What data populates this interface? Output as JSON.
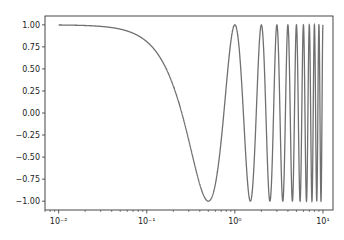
{
  "chart_data": {
    "type": "line",
    "title": "",
    "xlabel": "",
    "ylabel": "",
    "xscale": "log",
    "xlim": [
      0.007,
      13
    ],
    "ylim": [
      -1.1,
      1.1
    ],
    "grid": false,
    "legend": null,
    "x_ticks": [
      {
        "value": 0.01,
        "label": "10⁻²"
      },
      {
        "value": 0.1,
        "label": "10⁻¹"
      },
      {
        "value": 1,
        "label": "10⁰"
      },
      {
        "value": 10,
        "label": "10¹"
      }
    ],
    "y_ticks": [
      {
        "value": 1.0,
        "label": "1.00"
      },
      {
        "value": 0.75,
        "label": "0.75"
      },
      {
        "value": 0.5,
        "label": "0.50"
      },
      {
        "value": 0.25,
        "label": "0.25"
      },
      {
        "value": 0.0,
        "label": "0.00"
      },
      {
        "value": -0.25,
        "label": "−0.25"
      },
      {
        "value": -0.5,
        "label": "−0.50"
      },
      {
        "value": -0.75,
        "label": "−0.75"
      },
      {
        "value": -1.0,
        "label": "−1.00"
      }
    ],
    "series": [
      {
        "name": "cos(2πx)",
        "color": "#707070",
        "function": "cos(2*pi*x)",
        "x_range": [
          0.01,
          10
        ],
        "sample_points": [
          {
            "x": 0.01,
            "y": 1.0
          },
          {
            "x": 0.1,
            "y": 0.81
          },
          {
            "x": 0.25,
            "y": 0.0
          },
          {
            "x": 0.5,
            "y": -1.0
          },
          {
            "x": 0.75,
            "y": 0.0
          },
          {
            "x": 1.0,
            "y": 1.0
          },
          {
            "x": 1.5,
            "y": -1.0
          },
          {
            "x": 2.0,
            "y": 1.0
          },
          {
            "x": 3.0,
            "y": 1.0
          },
          {
            "x": 5.0,
            "y": 1.0
          },
          {
            "x": 10.0,
            "y": 1.0
          }
        ]
      }
    ]
  }
}
